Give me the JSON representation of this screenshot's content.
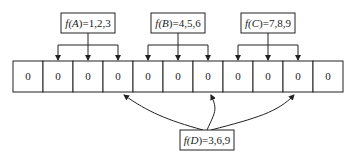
{
  "diagram": {
    "title": "",
    "bit_array": [
      "0",
      "0",
      "0",
      "0",
      "0",
      "0",
      "0",
      "0",
      "0",
      "0",
      "0"
    ],
    "hash_functions_top": [
      {
        "label_prefix": "f(",
        "var": "A",
        "label_suffix": ")=1,2,3",
        "text": "f(A)=1,2,3",
        "targets": [
          1,
          2,
          3
        ]
      },
      {
        "label_prefix": "f(",
        "var": "B",
        "label_suffix": ")=4,5,6",
        "text": "f(B)=4,5,6",
        "targets": [
          4,
          5,
          6
        ]
      },
      {
        "label_prefix": "f(",
        "var": "C",
        "label_suffix": ")=7,8,9",
        "text": "f(C)=7,8,9",
        "targets": [
          7,
          8,
          9
        ]
      }
    ],
    "hash_function_bottom": {
      "text": "f(D)=3,6,9",
      "targets": [
        3,
        6,
        9
      ]
    }
  }
}
